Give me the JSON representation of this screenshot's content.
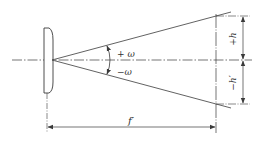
{
  "diagram": {
    "type": "optical-field-of-view",
    "labels": {
      "plus_omega": "+ ω",
      "minus_omega": "−ω",
      "plus_h": "+h",
      "minus_h_prime": "−h′",
      "focal_length": "f′"
    },
    "colors": {
      "line": "#3a3a3a",
      "background": "#ffffff"
    }
  }
}
